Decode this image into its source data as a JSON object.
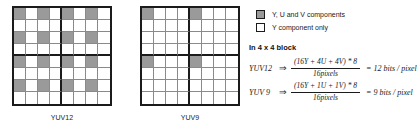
{
  "diagram": {
    "grids": [
      {
        "id": "yuv12",
        "caption": "YUV12",
        "rows": 8,
        "cols": 8,
        "block_size": 4,
        "shaded_cells": [
          [
            0,
            0
          ],
          [
            0,
            2
          ],
          [
            0,
            4
          ],
          [
            0,
            6
          ],
          [
            2,
            0
          ],
          [
            2,
            2
          ],
          [
            2,
            4
          ],
          [
            2,
            6
          ],
          [
            4,
            0
          ],
          [
            4,
            2
          ],
          [
            4,
            4
          ],
          [
            4,
            6
          ],
          [
            6,
            0
          ],
          [
            6,
            2
          ],
          [
            6,
            4
          ],
          [
            6,
            6
          ]
        ]
      },
      {
        "id": "yuv9",
        "caption": "YUV9",
        "rows": 8,
        "cols": 8,
        "block_size": 4,
        "shaded_cells": [
          [
            0,
            0
          ],
          [
            0,
            4
          ],
          [
            4,
            0
          ],
          [
            4,
            4
          ]
        ]
      }
    ],
    "legend": [
      {
        "swatch": "filled",
        "label": "Y,  U and V components"
      },
      {
        "swatch": "empty",
        "label": "Y component only"
      }
    ],
    "block_heading": "In 4 x 4 block",
    "equations": [
      {
        "name": "YUV12",
        "arrow": "⇒",
        "numerator": "(16Y + 4U + 4V) * 8",
        "denominator": "16pixels",
        "result": "= 12 bits / pixel"
      },
      {
        "name": "YUV 9",
        "arrow": "⇒",
        "numerator": "(16Y + 1U + 1V) * 8",
        "denominator": "16pixels",
        "result": "= 9 bits / pixel"
      }
    ]
  },
  "colors": {
    "shaded": "#9a9a9a",
    "empty": "#ffffff",
    "outline": "#1b1b1b",
    "inner_line": "#8a8a8a"
  }
}
